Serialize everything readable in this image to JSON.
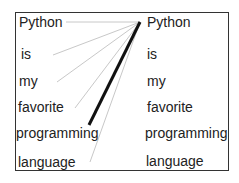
{
  "diagram": {
    "type": "attention-alignment",
    "left_tokens": [
      "Python",
      "is",
      "my",
      "favorite",
      "programming",
      "language"
    ],
    "right_tokens": [
      "Python",
      "is",
      "my",
      "favorite",
      "programming",
      "language"
    ],
    "focus_right_token": "Python",
    "links": [
      {
        "from": "Python",
        "to": "Python",
        "weight": "light"
      },
      {
        "from": "is",
        "to": "Python",
        "weight": "light"
      },
      {
        "from": "my",
        "to": "Python",
        "weight": "light"
      },
      {
        "from": "favorite",
        "to": "Python",
        "weight": "light"
      },
      {
        "from": "programming",
        "to": "Python",
        "weight": "heavy"
      },
      {
        "from": "language",
        "to": "Python",
        "weight": "light"
      }
    ],
    "colors": {
      "light_line": "#c8c8c8",
      "heavy_line": "#111111",
      "border": "#333333",
      "text": "#222222"
    }
  }
}
